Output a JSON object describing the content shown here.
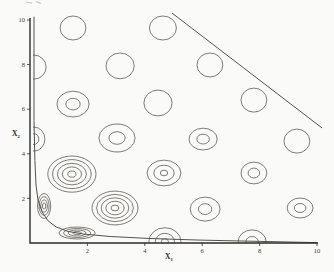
{
  "figure": {
    "background": "#fafaf8",
    "contour_ink": "#55524c",
    "axis_ink": "#2e2c28",
    "text_ink": "#3a3a36",
    "corner_marks_ink": "#c6c4bd"
  },
  "chart_data": {
    "type": "contour",
    "title": "",
    "xlabel": "X1",
    "ylabel": "X2",
    "x_axis_label": {
      "base": "X",
      "sub": "1"
    },
    "y_axis_label": {
      "base": "X",
      "sub": "2"
    },
    "xlim": [
      0,
      10
    ],
    "ylim": [
      0,
      10
    ],
    "grid": false,
    "legend": "none",
    "x_ticks": [
      2,
      4,
      6,
      8,
      10
    ],
    "y_ticks": [
      2,
      4,
      6,
      8,
      10
    ],
    "x_tick_labels": [
      "2",
      "4",
      "6",
      "8",
      "10"
    ],
    "y_tick_labels": [
      "2",
      "4",
      "6",
      "8",
      "10"
    ],
    "contour_clusters": [
      {
        "x": 1.5,
        "y": 9.64,
        "rings": 1,
        "rx": 0.45,
        "ry": 0.54
      },
      {
        "x": 4.63,
        "y": 9.64,
        "rings": 1,
        "rx": 0.47,
        "ry": 0.54
      },
      {
        "x": 0.14,
        "y": 7.89,
        "rings": 1,
        "rx": 0.42,
        "ry": 0.54
      },
      {
        "x": 3.14,
        "y": 7.94,
        "rings": 1,
        "rx": 0.49,
        "ry": 0.58
      },
      {
        "x": 6.27,
        "y": 7.98,
        "rings": 1,
        "rx": 0.45,
        "ry": 0.54
      },
      {
        "x": 1.5,
        "y": 6.23,
        "rings": 2,
        "rx": 0.56,
        "ry": 0.58
      },
      {
        "x": 4.46,
        "y": 6.28,
        "rings": 1,
        "rx": 0.49,
        "ry": 0.58
      },
      {
        "x": 7.8,
        "y": 6.41,
        "rings": 1,
        "rx": 0.45,
        "ry": 0.54
      },
      {
        "x": 0.14,
        "y": 4.66,
        "rings": 2,
        "rx": 0.38,
        "ry": 0.54
      },
      {
        "x": 3.03,
        "y": 4.71,
        "rings": 2,
        "rx": 0.63,
        "ry": 0.63
      },
      {
        "x": 6.03,
        "y": 4.66,
        "rings": 2,
        "rx": 0.49,
        "ry": 0.49
      },
      {
        "x": 9.3,
        "y": 4.57,
        "rings": 1,
        "rx": 0.45,
        "ry": 0.54
      },
      {
        "x": 1.46,
        "y": 3.09,
        "rings": 5,
        "rx": 0.84,
        "ry": 0.81
      },
      {
        "x": 4.67,
        "y": 3.14,
        "rings": 3,
        "rx": 0.59,
        "ry": 0.58
      },
      {
        "x": 7.8,
        "y": 3.14,
        "rings": 2,
        "rx": 0.45,
        "ry": 0.49
      },
      {
        "x": 0.49,
        "y": 1.66,
        "rings": 4,
        "rx": 0.23,
        "ry": 0.56
      },
      {
        "x": 2.96,
        "y": 1.57,
        "rings": 5,
        "rx": 0.8,
        "ry": 0.76
      },
      {
        "x": 6.1,
        "y": 1.52,
        "rings": 2,
        "rx": 0.52,
        "ry": 0.54
      },
      {
        "x": 9.41,
        "y": 1.57,
        "rings": 2,
        "rx": 0.45,
        "ry": 0.45
      },
      {
        "x": 1.64,
        "y": 0.45,
        "rings": 4,
        "rx": 0.63,
        "ry": 0.27
      },
      {
        "x": 4.7,
        "y": 0.06,
        "rings": 3,
        "rx": 0.56,
        "ry": 0.63
      },
      {
        "x": 7.74,
        "y": 0.05,
        "rings": 2,
        "rx": 0.49,
        "ry": 0.54
      }
    ],
    "ring_fractions": {
      "1": [
        1
      ],
      "2": [
        1,
        0.45
      ],
      "3": [
        1,
        0.6,
        0.22
      ],
      "4": [
        1,
        0.75,
        0.5,
        0.25
      ],
      "5": [
        1,
        0.8,
        0.6,
        0.4,
        0.17
      ]
    },
    "constraint_line": {
      "x1": 4.95,
      "y1": 10.31,
      "x2": 10.17,
      "y2": 5.16
    },
    "boundary_curve": [
      [
        0.14,
        10.15
      ],
      [
        0.14,
        7.0
      ],
      [
        0.14,
        5.5
      ],
      [
        0.17,
        3.7
      ],
      [
        0.21,
        2.6
      ],
      [
        0.28,
        1.93
      ],
      [
        0.42,
        1.39
      ],
      [
        0.63,
        0.99
      ],
      [
        0.91,
        0.72
      ],
      [
        1.32,
        0.52
      ],
      [
        1.88,
        0.4
      ],
      [
        2.79,
        0.29
      ],
      [
        4.18,
        0.2
      ],
      [
        5.92,
        0.13
      ],
      [
        8.01,
        0.07
      ],
      [
        10.0,
        0.02
      ]
    ]
  }
}
